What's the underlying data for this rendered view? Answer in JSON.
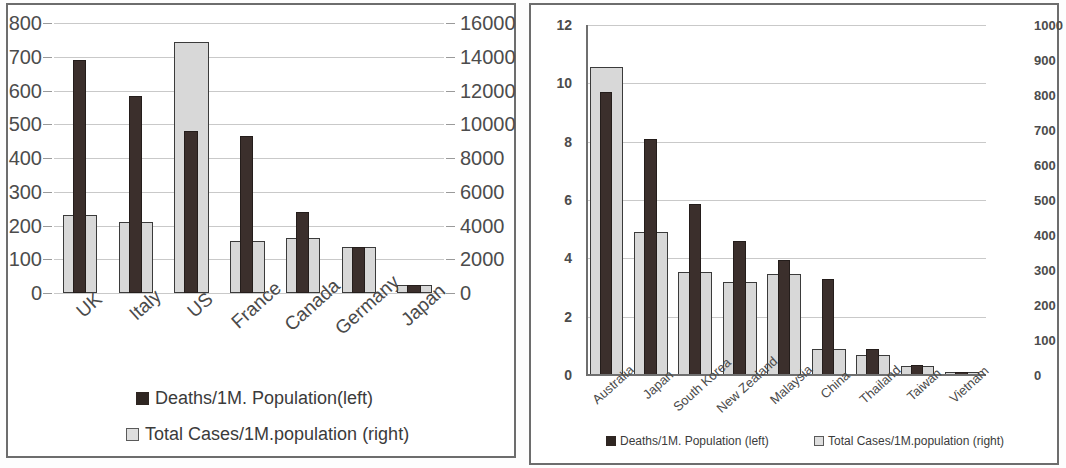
{
  "charts": [
    {
      "id": "left-chart",
      "panel_name": "western-countries-chart-panel",
      "legend": {
        "deaths": "Deaths/1M. Population(left)",
        "cases": "Total Cases/1M.population (right)"
      },
      "chart_data": {
        "type": "bar",
        "title": "",
        "xlabel": "",
        "ylabel": "",
        "grid": true,
        "legend_position": "bottom",
        "categories": [
          "UK",
          "Italy",
          "US",
          "France",
          "Canada",
          "Germany",
          "Japan"
        ],
        "left_axis": {
          "label": "Deaths/1M. Population(left)",
          "ylim": [
            0,
            800
          ],
          "ticks": [
            0,
            100,
            200,
            300,
            400,
            500,
            600,
            700,
            800
          ]
        },
        "right_axis": {
          "label": "Total Cases/1M.population (right)",
          "ylim": [
            0,
            16000
          ],
          "ticks": [
            0,
            2000,
            4000,
            6000,
            8000,
            10000,
            12000,
            14000,
            16000
          ]
        },
        "series": [
          {
            "name": "Deaths/1M. Population(left)",
            "axis": "left",
            "color": "#3b2f2c",
            "values": [
              690,
              585,
              480,
              465,
              240,
              135,
              25
            ]
          },
          {
            "name": "Total Cases/1M.population (right)",
            "axis": "right",
            "color": "#d8d8d8",
            "values": [
              4600,
              4200,
              14900,
              3100,
              3250,
              2700,
              500
            ]
          }
        ]
      }
    },
    {
      "id": "right-chart",
      "panel_name": "asia-pacific-countries-chart-panel",
      "legend": {
        "deaths": "Deaths/1M. Population (left)",
        "cases": "Total Cases/1M.population (right)"
      },
      "chart_data": {
        "type": "bar",
        "title": "",
        "xlabel": "",
        "ylabel": "",
        "grid": true,
        "legend_position": "bottom",
        "categories": [
          "Australia",
          "Japan",
          "South Korea",
          "New Zealand",
          "Malaysia",
          "China",
          "Thailand",
          "Taiwan",
          "Vietnam"
        ],
        "left_axis": {
          "label": "Deaths/1M. Population (left)",
          "ylim": [
            0,
            12
          ],
          "ticks": [
            0,
            2,
            4,
            6,
            8,
            10,
            12
          ]
        },
        "right_axis": {
          "label": "Total Cases/1M.population (right)",
          "ylim": [
            0,
            1000
          ],
          "ticks": [
            0,
            100,
            200,
            300,
            400,
            500,
            600,
            700,
            800,
            900,
            1000
          ]
        },
        "series": [
          {
            "name": "Deaths/1M. Population (left)",
            "axis": "left",
            "color": "#1d1715",
            "values": [
              9.7,
              8.1,
              5.85,
              4.6,
              3.95,
              3.3,
              0.9,
              0.35,
              0.1
            ]
          },
          {
            "name": "Total Cases/1M.population (right)",
            "axis": "right",
            "color": "#d8d8d8",
            "values": [
              880,
              408,
              295,
              265,
              288,
              73,
              57,
              25,
              10
            ]
          }
        ]
      }
    }
  ]
}
